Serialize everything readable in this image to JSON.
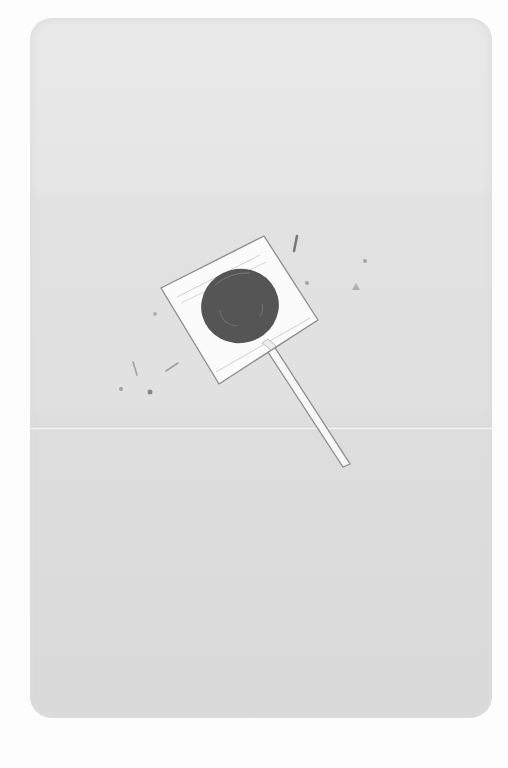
{
  "scene": {
    "subject": "lollipop",
    "background_color": "#fdfdfd",
    "card_color": "#e3e3e3",
    "wrapper_color": "#fbfbfb",
    "candy_color": "#555555",
    "stick_color": "#f7f7f7",
    "outline_color": "#8a8a8a",
    "speck_color": "#9a9a9a"
  }
}
